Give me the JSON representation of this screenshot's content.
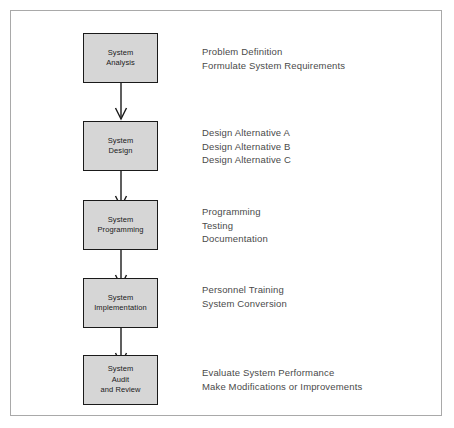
{
  "diagram": {
    "frame_color": "#a9a9a9",
    "box_fill_color": "#d6d6d6",
    "box_border_color": "#1a1a1a",
    "annotation_text_color": "#4a4a4a",
    "arrow_color": "#1a1a1a",
    "stages": [
      {
        "id": "system-analysis",
        "box_lines": [
          "System",
          "Analysis"
        ],
        "annotations": [
          "Problem Definition",
          "Formulate System Requirements"
        ]
      },
      {
        "id": "system-design",
        "box_lines": [
          "System",
          "Design"
        ],
        "annotations": [
          "Design Alternative A",
          "Design Alternative B",
          "Design Alternative C"
        ]
      },
      {
        "id": "system-programming",
        "box_lines": [
          "System",
          "Programming"
        ],
        "annotations": [
          "Programming",
          "Testing",
          "Documentation"
        ]
      },
      {
        "id": "system-implementation",
        "box_lines": [
          "System",
          "Implementation"
        ],
        "annotations": [
          "Personnel Training",
          "System Conversion"
        ]
      },
      {
        "id": "system-audit-and-review",
        "box_lines": [
          "System",
          "Audit",
          "and Review"
        ],
        "annotations": [
          "Evaluate System Performance",
          "Make Modifications or Improvements"
        ]
      }
    ],
    "connectors": [
      {
        "id": "connector-1",
        "from": "system-analysis",
        "to": "system-design"
      },
      {
        "id": "connector-2",
        "from": "system-design",
        "to": "system-programming"
      },
      {
        "id": "connector-3",
        "from": "system-programming",
        "to": "system-implementation"
      },
      {
        "id": "connector-4",
        "from": "system-implementation",
        "to": "system-audit-and-review"
      }
    ]
  }
}
